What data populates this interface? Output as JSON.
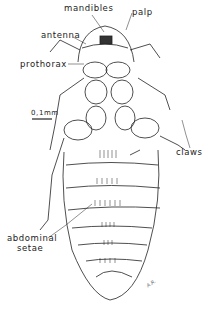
{
  "figure": {
    "labels": {
      "mandibles": "mandibles",
      "palp": "palp",
      "antenna": "antenna",
      "prothorax": "prothorax",
      "claws": "claws",
      "abdominal_1": "abdominal",
      "abdominal_2": "setae"
    },
    "scale_bar": "0,1mm",
    "signature": "A.R."
  }
}
